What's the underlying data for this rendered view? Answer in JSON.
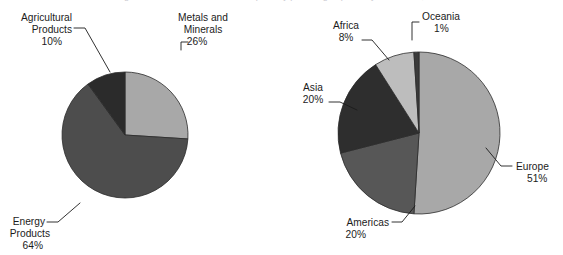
{
  "figure": {
    "background_color": "#ffffff",
    "text_color": "#1b1b1b",
    "clipped_title": "Figure 3  Canada's merchandise exports by product group and by destination, 2014"
  },
  "chart_data": [
    {
      "type": "pie",
      "title": "",
      "id": "exports-by-product-group",
      "center": [
        125,
        135
      ],
      "radius": 63,
      "start_angle_deg": 90,
      "direction": "clockwise",
      "labels": [
        "Metals and Minerals",
        "Energy Products",
        "Agricultural Products"
      ],
      "values": [
        26,
        64,
        10
      ],
      "unit": "%",
      "legend": "none",
      "grid": false,
      "colors": [
        "#a8a8a8",
        "#4d4d4d",
        "#2b2b2b"
      ],
      "slices": [
        {
          "name": "Metals and Minerals",
          "label_line1": "Metals and",
          "label_line2": "Minerals",
          "value": 26,
          "value_label": "26%",
          "color": "#a8a8a8"
        },
        {
          "name": "Energy Products",
          "label_line1": "Energy",
          "label_line2": "Products",
          "value": 64,
          "value_label": "64%",
          "color": "#4d4d4d"
        },
        {
          "name": "Agricultural Products",
          "label_line1": "Agricultural",
          "label_line2": "Products",
          "value": 10,
          "value_label": "10%",
          "color": "#2b2b2b"
        }
      ]
    },
    {
      "type": "pie",
      "title": "",
      "id": "exports-by-destination",
      "center": [
        419,
        133
      ],
      "radius": 81,
      "start_angle_deg": 90,
      "direction": "clockwise",
      "labels": [
        "Europe",
        "Americas",
        "Asia",
        "Africa",
        "Oceania"
      ],
      "values": [
        51,
        20,
        20,
        8,
        1
      ],
      "unit": "%",
      "legend": "none",
      "grid": false,
      "colors": [
        "#a8a8a8",
        "#575757",
        "#2e2e2e",
        "#bdbdbd",
        "#3a3a3a"
      ],
      "slices": [
        {
          "name": "Europe",
          "label_line1": "Europe",
          "label_line2": "",
          "value": 51,
          "value_label": "51%",
          "color": "#a8a8a8"
        },
        {
          "name": "Americas",
          "label_line1": "Americas",
          "label_line2": "",
          "value": 20,
          "value_label": "20%",
          "color": "#575757"
        },
        {
          "name": "Asia",
          "label_line1": "Asia",
          "label_line2": "",
          "value": 20,
          "value_label": "20%",
          "color": "#2e2e2e"
        },
        {
          "name": "Africa",
          "label_line1": "Africa",
          "label_line2": "",
          "value": 8,
          "value_label": "8%",
          "color": "#bdbdbd"
        },
        {
          "name": "Oceania",
          "label_line1": "Oceania",
          "label_line2": "",
          "value": 1,
          "value_label": "1%",
          "color": "#3a3a3a"
        }
      ]
    }
  ]
}
